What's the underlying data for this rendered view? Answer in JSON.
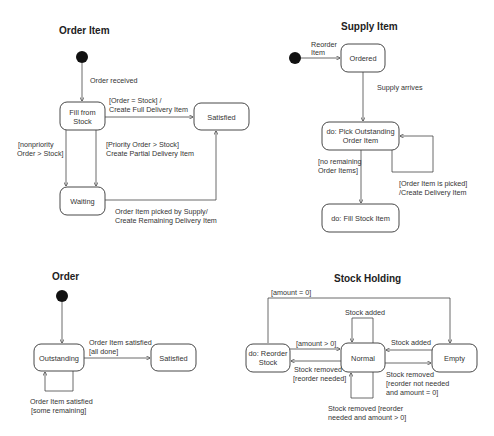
{
  "diagrams": {
    "order_item": {
      "title": "Order Item",
      "states": {
        "fill_from_stock": [
          "Fill from",
          "Stock"
        ],
        "satisfied": "Satisfied",
        "waiting": "Waiting"
      },
      "transitions": {
        "initial": "Order received",
        "full": [
          "[Order = Stock] /",
          "Create Full Delivery Item"
        ],
        "nonpriority": [
          "[nonpriority",
          "Order > Stock]"
        ],
        "priority": [
          "[Priority Order > Stock]",
          "Create Partial Delivery Item"
        ],
        "remaining": [
          "Order Item picked by Supply/",
          "Create Remaining Delivery Item"
        ]
      }
    },
    "supply_item": {
      "title": "Supply Item",
      "states": {
        "ordered": "Ordered",
        "pick": [
          "do: Pick Outstanding",
          "Order Item"
        ],
        "fill": "do: Fill Stock Item"
      },
      "transitions": {
        "initial": [
          "Reorder",
          "Item"
        ],
        "arrives": "Supply arrives",
        "no_remaining": [
          "[no remaining",
          "Order Items]"
        ],
        "picked": [
          "[Order Item is picked]",
          "/Create Delivery Item"
        ]
      }
    },
    "order": {
      "title": "Order",
      "states": {
        "outstanding": "Outstanding",
        "satisfied": "Satisfied"
      },
      "transitions": {
        "all_done": [
          "Order Item satisfied",
          "[all done]"
        ],
        "some_remaining": [
          "Order Item satisfied",
          "[some remaining]"
        ]
      }
    },
    "stock_holding": {
      "title": "Stock Holding",
      "states": {
        "reorder": [
          "do: Reorder",
          "Stock"
        ],
        "normal": "Normal",
        "empty": "Empty"
      },
      "transitions": {
        "amount_zero": "[amount = 0]",
        "stock_added_self": "Stock added",
        "amount_gt_zero": "[amount > 0]",
        "stock_added_empty": "Stock added",
        "removed_reorder": [
          "Stock removed",
          "[reorder needed]"
        ],
        "removed_not_needed": [
          "Stock removed",
          "[reorder not needed",
          "and amount = 0]"
        ],
        "removed_self": [
          "Stock removed [reorder",
          "needed and amount > 0]"
        ]
      }
    }
  }
}
